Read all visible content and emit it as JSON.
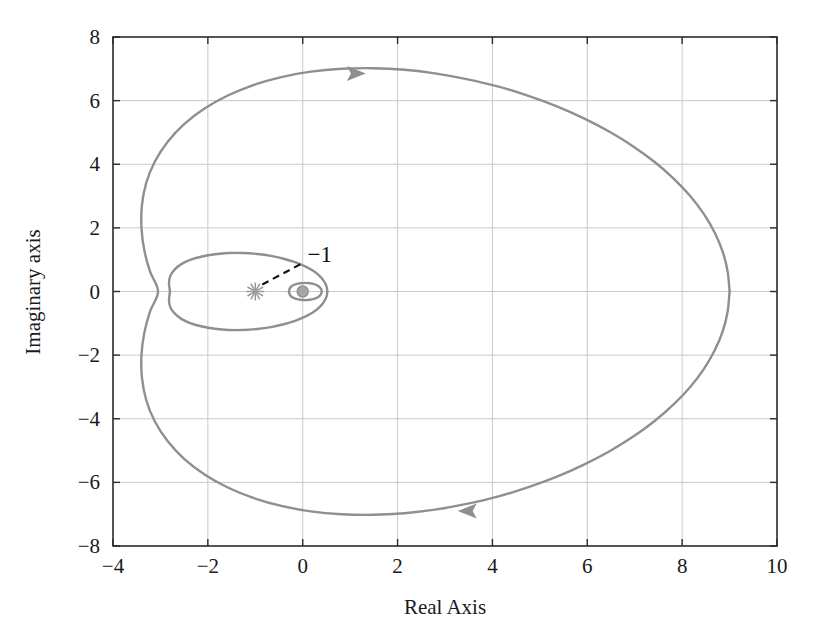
{
  "chart_data": {
    "type": "line",
    "title": "",
    "xlabel": "Real Axis",
    "ylabel": "Imaginary axis",
    "xlim": [
      -4,
      10
    ],
    "ylim": [
      -8,
      8
    ],
    "xticks": [
      -4,
      -2,
      0,
      2,
      4,
      6,
      8,
      10
    ],
    "yticks": [
      8,
      6,
      4,
      2,
      0,
      -2,
      -4,
      -6,
      -8
    ],
    "xtick_labels": [
      "−4",
      "−2",
      "0",
      "2",
      "4",
      "6",
      "8",
      "10"
    ],
    "ytick_labels": [
      "8",
      "6",
      "4",
      "2",
      "0",
      "−2",
      "−4",
      "−6",
      "−8"
    ],
    "grid": true,
    "grid_color": "#c9c9c9",
    "legend": "none",
    "curve_color": "#8f8f8f",
    "annotations": [
      {
        "name": "critical-point",
        "label": "−1",
        "marker": "asterisk",
        "x": -1,
        "y": 0,
        "label_x": 0.1,
        "label_y": 1.0,
        "leader_line": true
      },
      {
        "name": "direction-arrow-upper",
        "label": "",
        "marker": "arrowhead-right",
        "x": 1.1,
        "y": 6.85
      },
      {
        "name": "direction-arrow-lower",
        "label": "",
        "marker": "arrowhead-left",
        "x": 3.5,
        "y": -6.9
      },
      {
        "name": "origin-marker",
        "label": "",
        "marker": "dot",
        "x": 0.0,
        "y": 0.0
      }
    ],
    "series": [
      {
        "name": "nyquist-outer-loop",
        "description": "Large outer Nyquist contour",
        "closed": true,
        "points": [
          [
            9.0,
            0.0
          ],
          [
            8.96,
            0.62
          ],
          [
            8.86,
            1.23
          ],
          [
            8.69,
            1.84
          ],
          [
            8.46,
            2.43
          ],
          [
            8.17,
            3.0
          ],
          [
            7.82,
            3.55
          ],
          [
            7.42,
            4.07
          ],
          [
            6.97,
            4.56
          ],
          [
            6.47,
            5.02
          ],
          [
            5.93,
            5.44
          ],
          [
            5.36,
            5.82
          ],
          [
            4.76,
            6.15
          ],
          [
            4.13,
            6.44
          ],
          [
            3.48,
            6.67
          ],
          [
            2.82,
            6.85
          ],
          [
            2.15,
            6.97
          ],
          [
            1.48,
            7.02
          ],
          [
            0.82,
            7.0
          ],
          [
            0.17,
            6.91
          ],
          [
            -0.45,
            6.74
          ],
          [
            -1.04,
            6.49
          ],
          [
            -1.58,
            6.16
          ],
          [
            -2.07,
            5.75
          ],
          [
            -2.5,
            5.26
          ],
          [
            -2.85,
            4.7
          ],
          [
            -3.12,
            4.08
          ],
          [
            -3.3,
            3.41
          ],
          [
            -3.39,
            2.71
          ],
          [
            -3.4,
            2.0
          ],
          [
            -3.34,
            1.3
          ],
          [
            -3.22,
            0.63
          ],
          [
            -3.05,
            0.0
          ],
          [
            -3.22,
            -0.63
          ],
          [
            -3.34,
            -1.3
          ],
          [
            -3.4,
            -2.0
          ],
          [
            -3.39,
            -2.71
          ],
          [
            -3.3,
            -3.41
          ],
          [
            -3.12,
            -4.08
          ],
          [
            -2.85,
            -4.7
          ],
          [
            -2.5,
            -5.26
          ],
          [
            -2.07,
            -5.75
          ],
          [
            -1.58,
            -6.16
          ],
          [
            -1.04,
            -6.49
          ],
          [
            -0.45,
            -6.74
          ],
          [
            0.17,
            -6.91
          ],
          [
            0.82,
            -7.0
          ],
          [
            1.48,
            -7.02
          ],
          [
            2.15,
            -6.97
          ],
          [
            2.82,
            -6.85
          ],
          [
            3.48,
            -6.67
          ],
          [
            4.13,
            -6.44
          ],
          [
            4.76,
            -6.15
          ],
          [
            5.36,
            -5.82
          ],
          [
            5.93,
            -5.44
          ],
          [
            6.47,
            -5.02
          ],
          [
            6.97,
            -4.56
          ],
          [
            7.42,
            -4.07
          ],
          [
            7.82,
            -3.55
          ],
          [
            8.17,
            -3.0
          ],
          [
            8.46,
            -2.43
          ],
          [
            8.69,
            -1.84
          ],
          [
            8.86,
            -1.23
          ],
          [
            8.96,
            -0.62
          ],
          [
            9.0,
            0.0
          ]
        ]
      },
      {
        "name": "nyquist-middle-loop",
        "description": "Medium inner loop passing left of the critical point",
        "closed": true,
        "points": [
          [
            0.52,
            0.0
          ],
          [
            0.5,
            0.17
          ],
          [
            0.44,
            0.34
          ],
          [
            0.35,
            0.5
          ],
          [
            0.22,
            0.65
          ],
          [
            0.05,
            0.79
          ],
          [
            -0.16,
            0.92
          ],
          [
            -0.4,
            1.03
          ],
          [
            -0.67,
            1.12
          ],
          [
            -0.96,
            1.18
          ],
          [
            -1.26,
            1.21
          ],
          [
            -1.56,
            1.21
          ],
          [
            -1.85,
            1.17
          ],
          [
            -2.12,
            1.1
          ],
          [
            -2.36,
            1.0
          ],
          [
            -2.56,
            0.86
          ],
          [
            -2.7,
            0.69
          ],
          [
            -2.79,
            0.5
          ],
          [
            -2.82,
            0.26
          ],
          [
            -2.8,
            0.0
          ],
          [
            -2.82,
            -0.26
          ],
          [
            -2.79,
            -0.5
          ],
          [
            -2.7,
            -0.69
          ],
          [
            -2.56,
            -0.86
          ],
          [
            -2.36,
            -1.0
          ],
          [
            -2.12,
            -1.1
          ],
          [
            -1.85,
            -1.17
          ],
          [
            -1.56,
            -1.21
          ],
          [
            -1.26,
            -1.21
          ],
          [
            -0.96,
            -1.18
          ],
          [
            -0.67,
            -1.12
          ],
          [
            -0.4,
            -1.03
          ],
          [
            -0.16,
            -0.92
          ],
          [
            0.05,
            -0.79
          ],
          [
            0.22,
            -0.65
          ],
          [
            0.35,
            -0.5
          ],
          [
            0.44,
            -0.34
          ],
          [
            0.5,
            -0.17
          ],
          [
            0.52,
            0.0
          ]
        ]
      },
      {
        "name": "nyquist-small-loop",
        "description": "Small loop encircling the origin",
        "closed": true,
        "points": [
          [
            0.4,
            0.0
          ],
          [
            0.39,
            0.07
          ],
          [
            0.36,
            0.13
          ],
          [
            0.31,
            0.19
          ],
          [
            0.24,
            0.23
          ],
          [
            0.15,
            0.26
          ],
          [
            0.05,
            0.27
          ],
          [
            -0.05,
            0.26
          ],
          [
            -0.14,
            0.23
          ],
          [
            -0.21,
            0.19
          ],
          [
            -0.26,
            0.13
          ],
          [
            -0.28,
            0.07
          ],
          [
            -0.29,
            0.0
          ],
          [
            -0.28,
            -0.07
          ],
          [
            -0.26,
            -0.13
          ],
          [
            -0.21,
            -0.19
          ],
          [
            -0.14,
            -0.23
          ],
          [
            -0.05,
            -0.26
          ],
          [
            0.05,
            -0.27
          ],
          [
            0.15,
            -0.26
          ],
          [
            0.24,
            -0.23
          ],
          [
            0.31,
            -0.19
          ],
          [
            0.36,
            -0.13
          ],
          [
            0.39,
            -0.07
          ],
          [
            0.4,
            0.0
          ]
        ]
      }
    ]
  },
  "plot_geometry": {
    "left": 113,
    "top": 37,
    "right": 777,
    "bottom": 546
  }
}
